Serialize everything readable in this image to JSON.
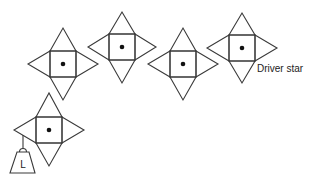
{
  "diagram": {
    "type": "stars-chain",
    "colors": {
      "line": "#3a3a3a",
      "dot": "#111111",
      "background": "#ffffff"
    },
    "stars": [
      {
        "id": "star-1",
        "cx": 63,
        "cy": 64,
        "half": 13,
        "tip": 35
      },
      {
        "id": "star-2",
        "cx": 122,
        "cy": 47,
        "half": 13,
        "tip": 35
      },
      {
        "id": "star-3",
        "cx": 183,
        "cy": 64,
        "half": 13,
        "tip": 35
      },
      {
        "id": "star-4",
        "cx": 242,
        "cy": 48,
        "half": 13,
        "tip": 35,
        "label": "Driver star"
      },
      {
        "id": "star-5",
        "cx": 49,
        "cy": 130,
        "half": 13,
        "tip": 36,
        "load": "L"
      }
    ],
    "driver_label": "Driver star",
    "load_label": "L"
  }
}
